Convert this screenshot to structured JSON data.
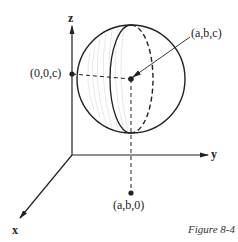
{
  "figure": {
    "caption": "Figure 8-4",
    "axes": {
      "x_label": "x",
      "y_label": "y",
      "z_label": "z"
    },
    "points": {
      "center": "(a,b,c)",
      "z_projection": "(0,0,c)",
      "xy_projection": "(a,b,0)"
    },
    "colors": {
      "stroke": "#222222",
      "shading": "#dddddd"
    }
  }
}
